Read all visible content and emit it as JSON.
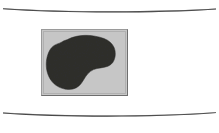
{
  "page": {
    "background_color": "#ffffff",
    "width": 219,
    "height": 133,
    "caption": ""
  },
  "rules": {
    "top": {
      "name": "top-rule",
      "color": "#3c3c3c",
      "y": 11,
      "curve": "concave-up",
      "thickness_center": 1.6,
      "thickness_ends": 0.4
    },
    "bottom": {
      "name": "bottom-rule",
      "color": "#3c3c3c",
      "y": 115,
      "curve": "concave-up",
      "thickness_center": 1.6,
      "thickness_ends": 0.4
    }
  },
  "figure": {
    "name": "figure-box",
    "x": 41,
    "y": 29,
    "width": 87,
    "height": 67,
    "background_color": "#c6c6c6",
    "border_light_color": "#9a9a9a",
    "border_dark_color": "#6e6e6e",
    "shape": {
      "name": "kidney-blob",
      "label": "dark kidney-shaped region",
      "fill_color": "#2f2f2d",
      "edge_color": "#242422"
    }
  }
}
